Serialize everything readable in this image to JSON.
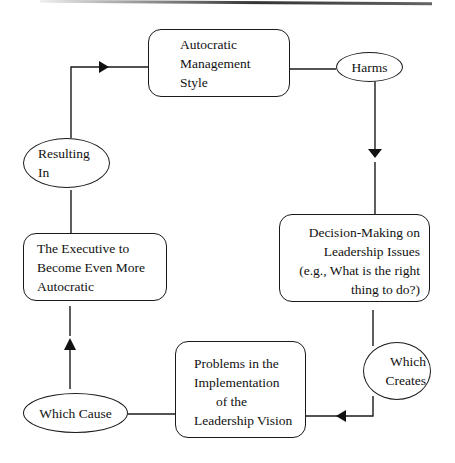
{
  "diagram": {
    "type": "cycle-flowchart",
    "nodes": [
      {
        "id": "autocratic-style",
        "shape": "rounded-box",
        "lines": [
          "Autocratic",
          "Management",
          "Style"
        ]
      },
      {
        "id": "harms",
        "shape": "ellipse",
        "lines": [
          "Harms"
        ]
      },
      {
        "id": "decision-making",
        "shape": "rounded-box",
        "lines": [
          "Decision-Making on",
          "Leadership Issues",
          "(e.g., What is the right",
          "thing to do?)"
        ]
      },
      {
        "id": "which-creates",
        "shape": "ellipse",
        "lines": [
          "Which",
          "Creates"
        ]
      },
      {
        "id": "problems",
        "shape": "rounded-box",
        "lines": [
          "Problems in the",
          "Implementation",
          "of the",
          "Leadership Vision"
        ]
      },
      {
        "id": "which-cause",
        "shape": "ellipse",
        "lines": [
          "Which Cause"
        ]
      },
      {
        "id": "executive",
        "shape": "rounded-box",
        "lines": [
          "The Executive to",
          "Become Even More",
          "Autocratic"
        ]
      },
      {
        "id": "resulting-in",
        "shape": "ellipse",
        "lines": [
          "Resulting",
          "In"
        ]
      }
    ],
    "edges": [
      {
        "from": "autocratic-style",
        "to": "harms"
      },
      {
        "from": "harms",
        "to": "decision-making",
        "arrow": "down"
      },
      {
        "from": "decision-making",
        "to": "which-creates"
      },
      {
        "from": "which-creates",
        "to": "problems",
        "arrow": "left"
      },
      {
        "from": "problems",
        "to": "which-cause"
      },
      {
        "from": "which-cause",
        "to": "executive",
        "arrow": "up"
      },
      {
        "from": "executive",
        "to": "resulting-in"
      },
      {
        "from": "resulting-in",
        "to": "autocratic-style",
        "arrow": "right"
      }
    ]
  },
  "colors": {
    "stroke": "#1a1a1a",
    "background": "#ffffff"
  }
}
